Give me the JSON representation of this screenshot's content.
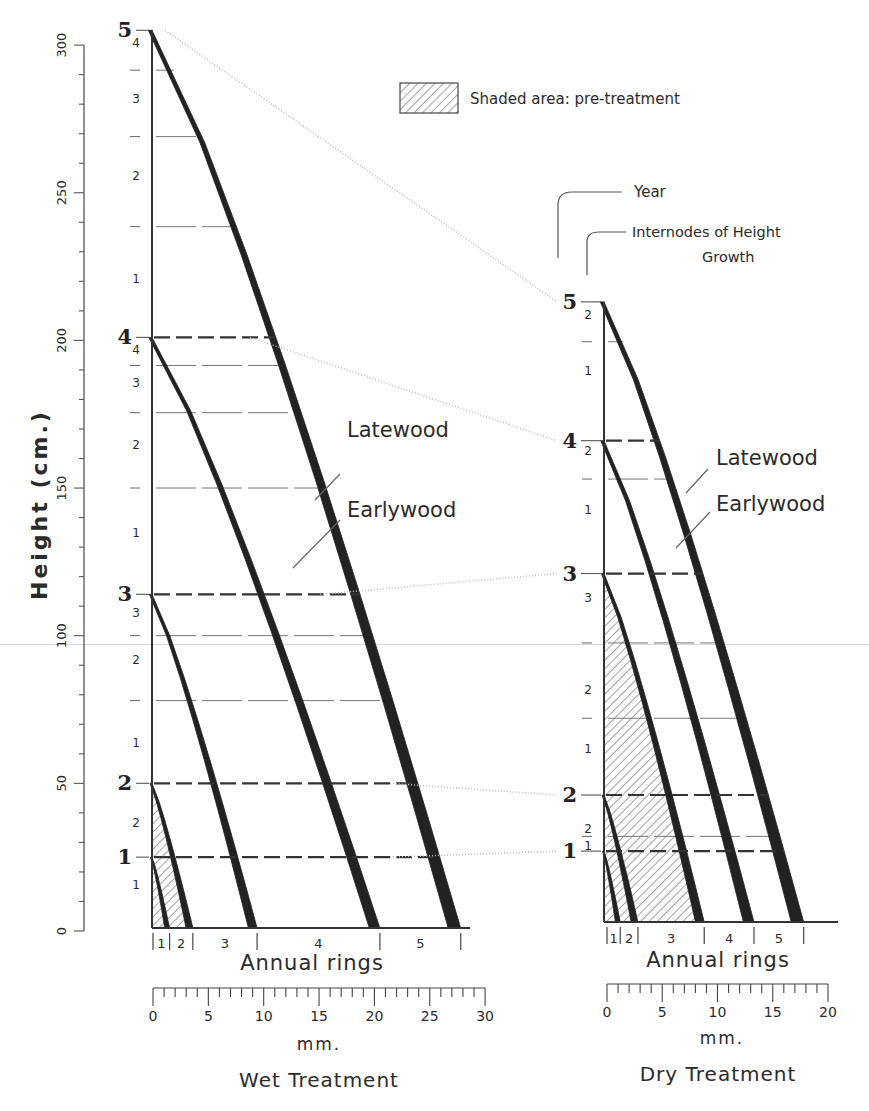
{
  "legend": {
    "shaded_label": "Shaded area: pre-treatment",
    "year_label": "Year",
    "internodes_label_line1": "Internodes of Height",
    "internodes_label_line2": "Growth"
  },
  "axis": {
    "height_label": "Height (cm.)",
    "height_ticks": [
      "0",
      "50",
      "100",
      "150",
      "200",
      "250",
      "300"
    ],
    "height_range_cm": [
      0,
      300
    ]
  },
  "panels": [
    {
      "id": "wet",
      "title": "Wet Treatment",
      "rings_label": "Annual rings",
      "mm_label": "mm.",
      "mm_ticks": [
        "0",
        "5",
        "10",
        "15",
        "20",
        "25",
        "30"
      ],
      "mm_range": [
        0,
        30
      ],
      "latewood_label": "Latewood",
      "earlywood_label": "Earlywood",
      "year_heights_cm": [
        {
          "year": "1",
          "h": 24
        },
        {
          "year": "2",
          "h": 49
        },
        {
          "year": "3",
          "h": 113
        },
        {
          "year": "4",
          "h": 200
        },
        {
          "year": "5",
          "h": 304
        }
      ],
      "internode_labels": [
        {
          "label": "1",
          "h": 15
        },
        {
          "label": "2",
          "h": 36
        },
        {
          "label": "1",
          "h": 63
        },
        {
          "label": "2",
          "h": 91
        },
        {
          "label": "3",
          "h": 107
        },
        {
          "label": "1",
          "h": 134
        },
        {
          "label": "2",
          "h": 164
        },
        {
          "label": "3",
          "h": 185
        },
        {
          "label": "4",
          "h": 196
        },
        {
          "label": "1",
          "h": 220
        },
        {
          "label": "2",
          "h": 255
        },
        {
          "label": "3",
          "h": 281
        },
        {
          "label": "4",
          "h": 300
        }
      ],
      "ring_labels": [
        "1",
        "2",
        "3",
        "4",
        "5"
      ],
      "ring_boundaries_mm": [
        0,
        1.5,
        3.6,
        9.4,
        20.5,
        27.8
      ],
      "pretreatment_years": 2
    },
    {
      "id": "dry",
      "title": "Dry Treatment",
      "rings_label": "Annual rings",
      "mm_label": "mm.",
      "mm_ticks": [
        "0",
        "5",
        "10",
        "15",
        "20"
      ],
      "mm_range": [
        0,
        20
      ],
      "latewood_label": "Latewood",
      "earlywood_label": "Earlywood",
      "year_heights_cm": [
        {
          "year": "1",
          "h": 24
        },
        {
          "year": "2",
          "h": 43
        },
        {
          "year": "3",
          "h": 118
        },
        {
          "year": "4",
          "h": 163
        },
        {
          "year": "5",
          "h": 210
        }
      ],
      "internode_labels": [
        {
          "label": "1",
          "h": 26
        },
        {
          "label": "2",
          "h": 32
        },
        {
          "label": "1",
          "h": 59
        },
        {
          "label": "2",
          "h": 79
        },
        {
          "label": "3",
          "h": 110
        },
        {
          "label": "1",
          "h": 140
        },
        {
          "label": "2",
          "h": 160
        },
        {
          "label": "1",
          "h": 187
        },
        {
          "label": "2",
          "h": 206
        }
      ],
      "ring_labels": [
        "1",
        "2",
        "3",
        "4",
        "5"
      ],
      "ring_boundaries_mm": [
        0,
        1.2,
        2.8,
        8.8,
        13.3,
        17.8
      ],
      "pretreatment_years": 3
    }
  ]
}
